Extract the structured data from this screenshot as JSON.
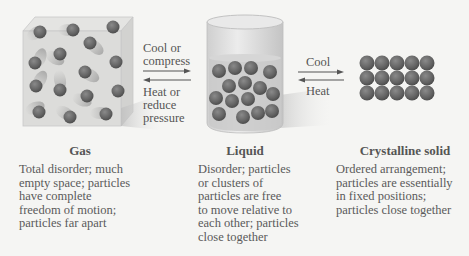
{
  "transitions": {
    "gas_liquid": {
      "forward_lines": [
        "Cool or",
        "compress"
      ],
      "reverse_lines": [
        "Heat or",
        "reduce",
        "pressure"
      ]
    },
    "liquid_solid": {
      "forward": "Cool",
      "reverse": "Heat"
    }
  },
  "states": [
    {
      "name": "Gas",
      "description_lines": [
        "Total disorder; much",
        "empty space; particles",
        "have complete",
        "freedom of motion;",
        "particles far apart"
      ]
    },
    {
      "name": "Liquid",
      "description_lines": [
        "Disorder; particles",
        "or clusters of",
        "particles are free",
        "to move relative to",
        "each other; particles",
        "close together"
      ]
    },
    {
      "name": "Crystalline solid",
      "description_lines": [
        "Ordered arrangement;",
        "particles are essentially",
        "in fixed positions;",
        "particles close together"
      ]
    }
  ],
  "colors": {
    "particle": "#6e6e6e",
    "particle_dark": "#555555",
    "container": "#d9d9d7",
    "background": "#f5f5f3",
    "arrow": "#555555"
  }
}
